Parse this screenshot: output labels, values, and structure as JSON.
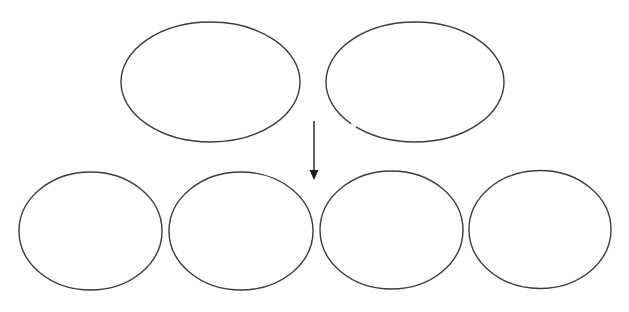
{
  "diagram": {
    "type": "split-diagram",
    "colors": {
      "background": "#ffffff",
      "stroke": "#3c3c3c",
      "arrow": "#1e1e1e"
    },
    "top_row": [
      {
        "id": "top-1",
        "label": ""
      },
      {
        "id": "top-2",
        "label": ""
      }
    ],
    "arrow": {
      "direction": "down",
      "label": ""
    },
    "bottom_row": [
      {
        "id": "bottom-1",
        "label": ""
      },
      {
        "id": "bottom-2",
        "label": ""
      },
      {
        "id": "bottom-3",
        "label": ""
      },
      {
        "id": "bottom-4",
        "label": ""
      }
    ]
  }
}
